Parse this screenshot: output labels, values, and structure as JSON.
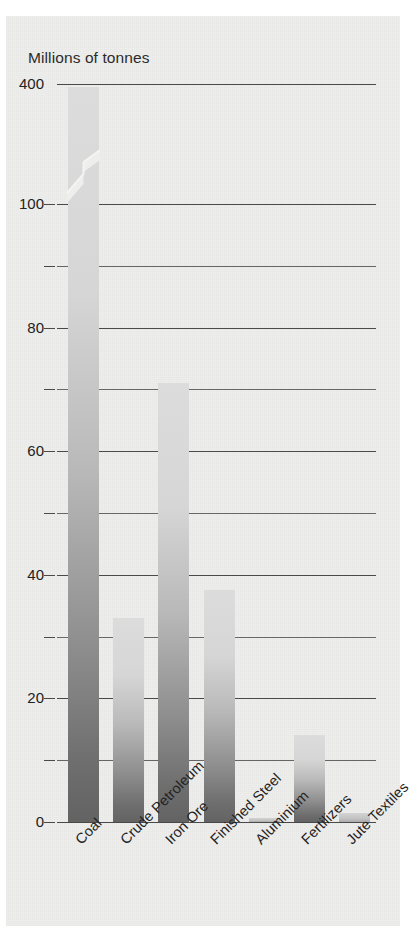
{
  "figure": {
    "background_color": "#eeeeec",
    "axis_title": "Millions of tonnes",
    "bar_color_light": "#dcdcdc",
    "bar_color_dark": "#636363",
    "grid_color": "#4a4a4a"
  },
  "chart_data": {
    "type": "bar",
    "title": "",
    "subtitle": "",
    "xlabel": "",
    "ylabel": "Millions of tonnes",
    "categories": [
      "Coal",
      "Crude Petroleum",
      "Iron Ore",
      "Finished Steel",
      "Aluminium",
      "Fertilizers",
      "Jute Textiles"
    ],
    "values": [
      390,
      33,
      71,
      37.5,
      0.6,
      14,
      1.5
    ],
    "ylim": [
      0,
      100
    ],
    "broken_axis": true,
    "broken_axis_note": "Y axis is broken between 100 and 400; the Coal bar is truncated with a zig-zag break mark.",
    "y_major_ticks": [
      0,
      20,
      40,
      60,
      80,
      100,
      400
    ],
    "y_minor_ticks": [
      10,
      30,
      50,
      70,
      90
    ],
    "y_tick_labels": [
      "0",
      "20",
      "40",
      "60",
      "80",
      "100",
      "400"
    ],
    "grid": true,
    "legend": false,
    "legend_position": "none",
    "annotations": []
  },
  "yaxis": {
    "labels": [
      {
        "text": "400",
        "value": 400
      },
      {
        "text": "100",
        "value": 100
      },
      {
        "text": "80",
        "value": 80
      },
      {
        "text": "60",
        "value": 60
      },
      {
        "text": "40",
        "value": 40
      },
      {
        "text": "20",
        "value": 20
      },
      {
        "text": "0",
        "value": 0
      }
    ]
  },
  "xaxis": {
    "labels": [
      "Coal",
      "Crude Petroleum",
      "Iron Ore",
      "Finished Steel",
      "Aluminium",
      "Fertilizers",
      "Jute Textiles"
    ]
  }
}
